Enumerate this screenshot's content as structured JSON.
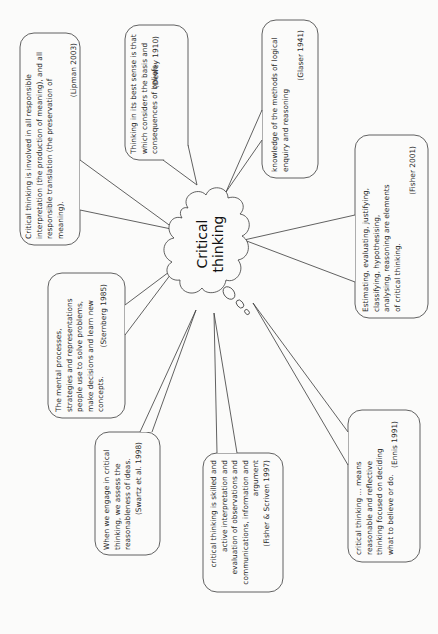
{
  "center": {
    "line1": "Critical",
    "line2": "thinking"
  },
  "bubbles": [
    {
      "id": "lipman",
      "text": "Critical thinking is involved in all responsible interpretation (the production of meaning), and all responsible translation (the preservation of meaning).",
      "cite": "(Lipman 2003)"
    },
    {
      "id": "dewey",
      "text": "Thinking in its best sense is that which considers the basis and consequences of beliefs.",
      "cite": "(Dewey 1910)"
    },
    {
      "id": "glaser",
      "text": "knowledge of the methods of logical enquiry and reasoning",
      "cite": "(Glaser 1941)"
    },
    {
      "id": "fisher2001",
      "text": "Estimating, evaluating, justifying, classifying, hypothesising, analysing, reasoning are elements of critical thinking.",
      "cite": "(Fisher 2001)"
    },
    {
      "id": "sternberg",
      "text": "The mental processes, strategies and representations people use to solve problems, make decisions and learn new concepts.",
      "cite": "(Sternberg 1985)"
    },
    {
      "id": "swartz",
      "text": "When we engage in critical thinking, we assess the reasonableness of ideas.",
      "cite": "(Swartz et al. 1998)"
    },
    {
      "id": "fisher_scriven",
      "text": "critical thinking is skilled and active interpretation and evaluation of observations and communications, information and argument",
      "cite": "(Fisher & Scriven 1997)"
    },
    {
      "id": "ennis",
      "text": "critical thinking ... means reasonable and reflective thinking focused on deciding what to believe or do.",
      "cite": "(Ennis 1991)"
    }
  ],
  "colors": {
    "stroke": "#3a3a3a",
    "background": "#fbfbfa",
    "text": "#2a2a2a"
  }
}
